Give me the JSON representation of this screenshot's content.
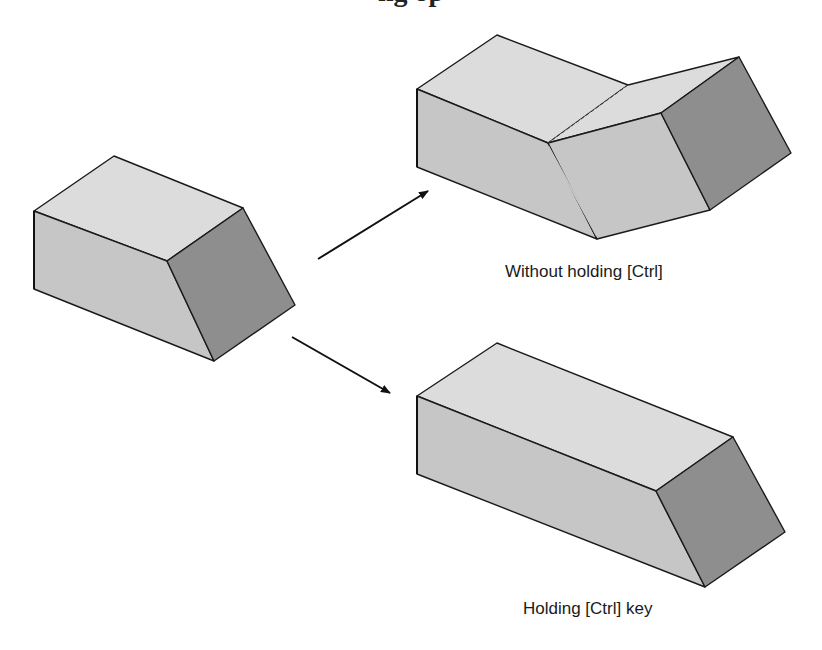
{
  "heading": {
    "text": "ng op",
    "note": "clipped at top edge; only descenders visible"
  },
  "colors": {
    "background": "#ffffff",
    "top_face": "#dcdcdc",
    "front_face": "#c6c6c6",
    "side_face": "#8e8e8e",
    "edge": "#1a1a1a"
  },
  "shapes": {
    "original": {
      "label": "",
      "top_face": "114,156 34,211 167,261 243,208",
      "front_face": "34,211 167,261 214,361 34,289",
      "side_face": "167,261 243,208 295,305 214,361"
    },
    "without_ctrl": {
      "label": "Without holding [Ctrl]",
      "top_face_left": "497,35 417,89 548,143 628,85",
      "top_face_right": "628,85 548,143 661,113 739,57",
      "front_face_left": "417,89 548,143 597,239 417,167",
      "front_face_right": "548,143 661,113 710,210 597,239",
      "side_face": "661,113 739,57 791,153 710,210",
      "fold_line": "628,85 548,143"
    },
    "holding_ctrl": {
      "label": "Holding [Ctrl] key",
      "top_face": "497,343 417,396 656,491 733,437",
      "front_face": "417,396 656,491 705,587 417,474",
      "side_face": "656,491 733,437 785,532 705,587"
    }
  },
  "arrows": [
    {
      "name": "arrow-to-without-ctrl",
      "x1": 318,
      "y1": 259,
      "x2": 428,
      "y2": 191
    },
    {
      "name": "arrow-to-holding-ctrl",
      "x1": 292,
      "y1": 337,
      "x2": 390,
      "y2": 393
    }
  ],
  "captions": {
    "top": "Without holding [Ctrl]",
    "bottom": "Holding [Ctrl] key"
  }
}
